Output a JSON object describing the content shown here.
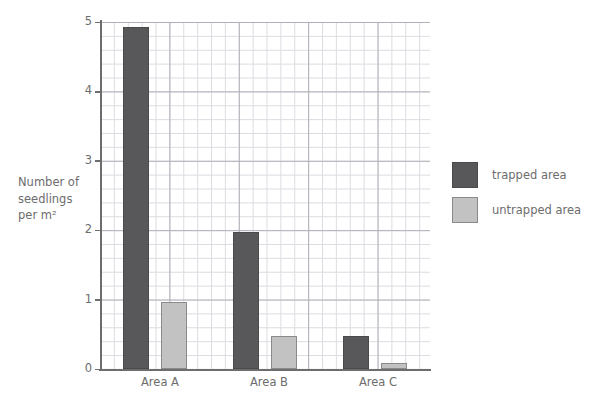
{
  "chart_data": {
    "type": "bar",
    "title": "",
    "xlabel": "",
    "ylabel": "Number of seedlings per m²",
    "ylabel_lines": [
      "Number of",
      "seedlings",
      "per m²"
    ],
    "categories": [
      "Area A",
      "Area B",
      "Area C"
    ],
    "series": [
      {
        "name": "trapped area",
        "color": "#58585a",
        "values": [
          4.93,
          1.97,
          0.47
        ]
      },
      {
        "name": "untrapped area",
        "color": "#c2c2c2",
        "values": [
          0.97,
          0.47,
          0.08
        ]
      }
    ],
    "ylim": [
      0,
      5
    ],
    "yticks": [
      0,
      1,
      2,
      3,
      4,
      5
    ],
    "ytick_labels": [
      "0",
      "1",
      "2",
      "3",
      "4",
      "5"
    ],
    "grid": true,
    "grid_major_step": 1,
    "grid_minor_step": 0.1,
    "legend_position": "right"
  },
  "legend": {
    "entries": [
      {
        "label": "trapped area",
        "swatch": "dark-gray-swatch"
      },
      {
        "label": "untrapped area",
        "swatch": "light-gray-swatch"
      }
    ]
  },
  "colors": {
    "trapped": "#58585a",
    "untrapped": "#c2c2c2",
    "untrapped_border": "#8a8a8a",
    "axis": "#6d6d6d",
    "grid_major": "#b0b0b8",
    "grid_minor": "#dcdce2",
    "background": "#ffffff"
  }
}
